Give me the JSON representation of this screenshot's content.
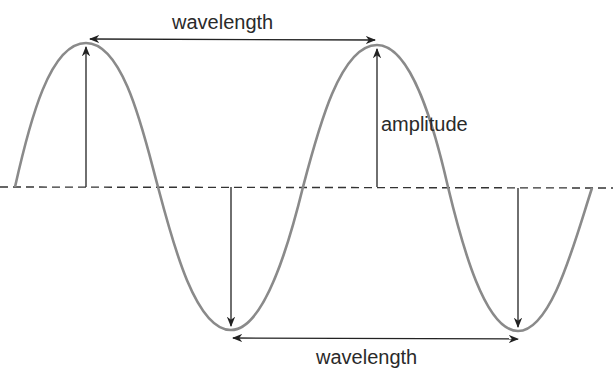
{
  "diagram": {
    "labels": {
      "wavelength_top": "wavelength",
      "amplitude": "amplitude",
      "wavelength_bottom": "wavelength"
    },
    "colors": {
      "wave": "#8a8a8a",
      "arrows": "#222222",
      "axis": "#333333",
      "text": "#2a2a2a"
    }
  }
}
